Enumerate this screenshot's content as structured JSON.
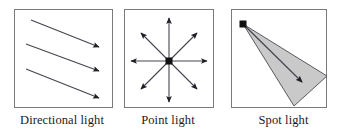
{
  "figure": {
    "background_color": "#ffffff",
    "box_border_color": "#6e6e6e",
    "stroke_color": "#3a3a46",
    "marker_color": "#111111",
    "cone_fill_color": "#c9c9c9",
    "panels": [
      {
        "id": "directional",
        "caption": "Directional light",
        "icon": "parallel-arrows-icon",
        "box": {
          "x": 14,
          "y": 9,
          "width": 99,
          "height": 99
        },
        "arrows": [
          {
            "x1": 31,
            "y1": 20,
            "x2": 101,
            "y2": 48
          },
          {
            "x1": 26,
            "y1": 44,
            "x2": 101,
            "y2": 72
          },
          {
            "x1": 26,
            "y1": 69,
            "x2": 101,
            "y2": 99
          }
        ]
      },
      {
        "id": "point",
        "caption": "Point light",
        "icon": "radial-arrows-icon",
        "box": {
          "x": 124,
          "y": 9,
          "width": 90,
          "height": 99
        },
        "center": {
          "x": 169,
          "y": 61
        },
        "arrows": [
          {
            "x1": 169,
            "y1": 61,
            "x2": 169,
            "y2": 17
          },
          {
            "x1": 169,
            "y1": 61,
            "x2": 169,
            "y2": 103
          },
          {
            "x1": 169,
            "y1": 61,
            "x2": 131,
            "y2": 61
          },
          {
            "x1": 169,
            "y1": 61,
            "x2": 208,
            "y2": 61
          },
          {
            "x1": 169,
            "y1": 61,
            "x2": 141,
            "y2": 33
          },
          {
            "x1": 169,
            "y1": 61,
            "x2": 198,
            "y2": 33
          },
          {
            "x1": 169,
            "y1": 61,
            "x2": 141,
            "y2": 90
          },
          {
            "x1": 169,
            "y1": 61,
            "x2": 198,
            "y2": 90
          }
        ]
      },
      {
        "id": "spot",
        "caption": "Spot light",
        "icon": "cone-arrow-icon",
        "box": {
          "x": 231,
          "y": 9,
          "width": 96,
          "height": 99
        },
        "apex": {
          "x": 243,
          "y": 24
        },
        "cone_points": "243,24 327,76 294,106",
        "axis_arrow": {
          "x1": 243,
          "y1": 24,
          "x2": 302,
          "y2": 82
        }
      }
    ]
  }
}
